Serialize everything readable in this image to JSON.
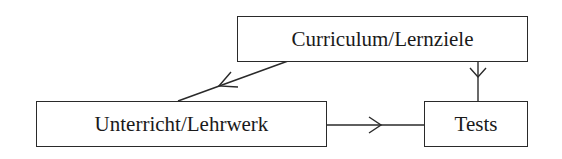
{
  "diagram": {
    "type": "flow",
    "nodes": [
      {
        "id": "curriculum",
        "label": "Curriculum/Lernziele"
      },
      {
        "id": "unterricht",
        "label": "Unterricht/Lehrwerk"
      },
      {
        "id": "tests",
        "label": "Tests"
      }
    ],
    "edges": [
      {
        "from": "curriculum",
        "to": "unterricht"
      },
      {
        "from": "curriculum",
        "to": "tests"
      },
      {
        "from": "unterricht",
        "to": "tests"
      }
    ]
  },
  "colors": {
    "stroke": "#2a2a2a",
    "text": "#1a1a1a",
    "background": "#ffffff"
  }
}
